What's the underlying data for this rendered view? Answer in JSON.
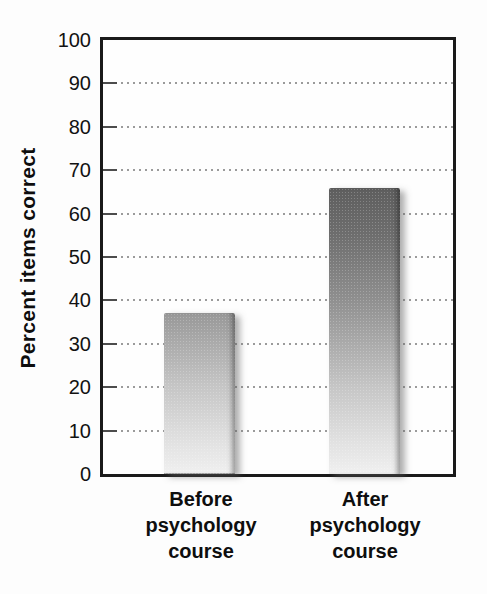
{
  "figure": {
    "background_color": "#fdfdfd",
    "frame_color": "#1a1a1a",
    "gridline_color": "#9b9b9b",
    "tick_label_color": "#121212"
  },
  "chart_data": {
    "type": "bar",
    "title": "",
    "categories": [
      "Before psychology course",
      "After psychology course"
    ],
    "categories_multiline": [
      "Before\npsychology\ncourse",
      "After\npsychology\ncourse"
    ],
    "values": [
      37,
      66
    ],
    "xlabel": "",
    "ylabel": "Percent items correct",
    "ylim": [
      0,
      100
    ],
    "yticks": [
      0,
      10,
      20,
      30,
      40,
      50,
      60,
      70,
      80,
      90,
      100
    ],
    "grid": "horizontal-dotted",
    "legend": "none",
    "bar_gradient_top": "#3d3d3d",
    "bar_gradient_bottom": "#f0f0f0",
    "bar_shadow_side": "right"
  }
}
